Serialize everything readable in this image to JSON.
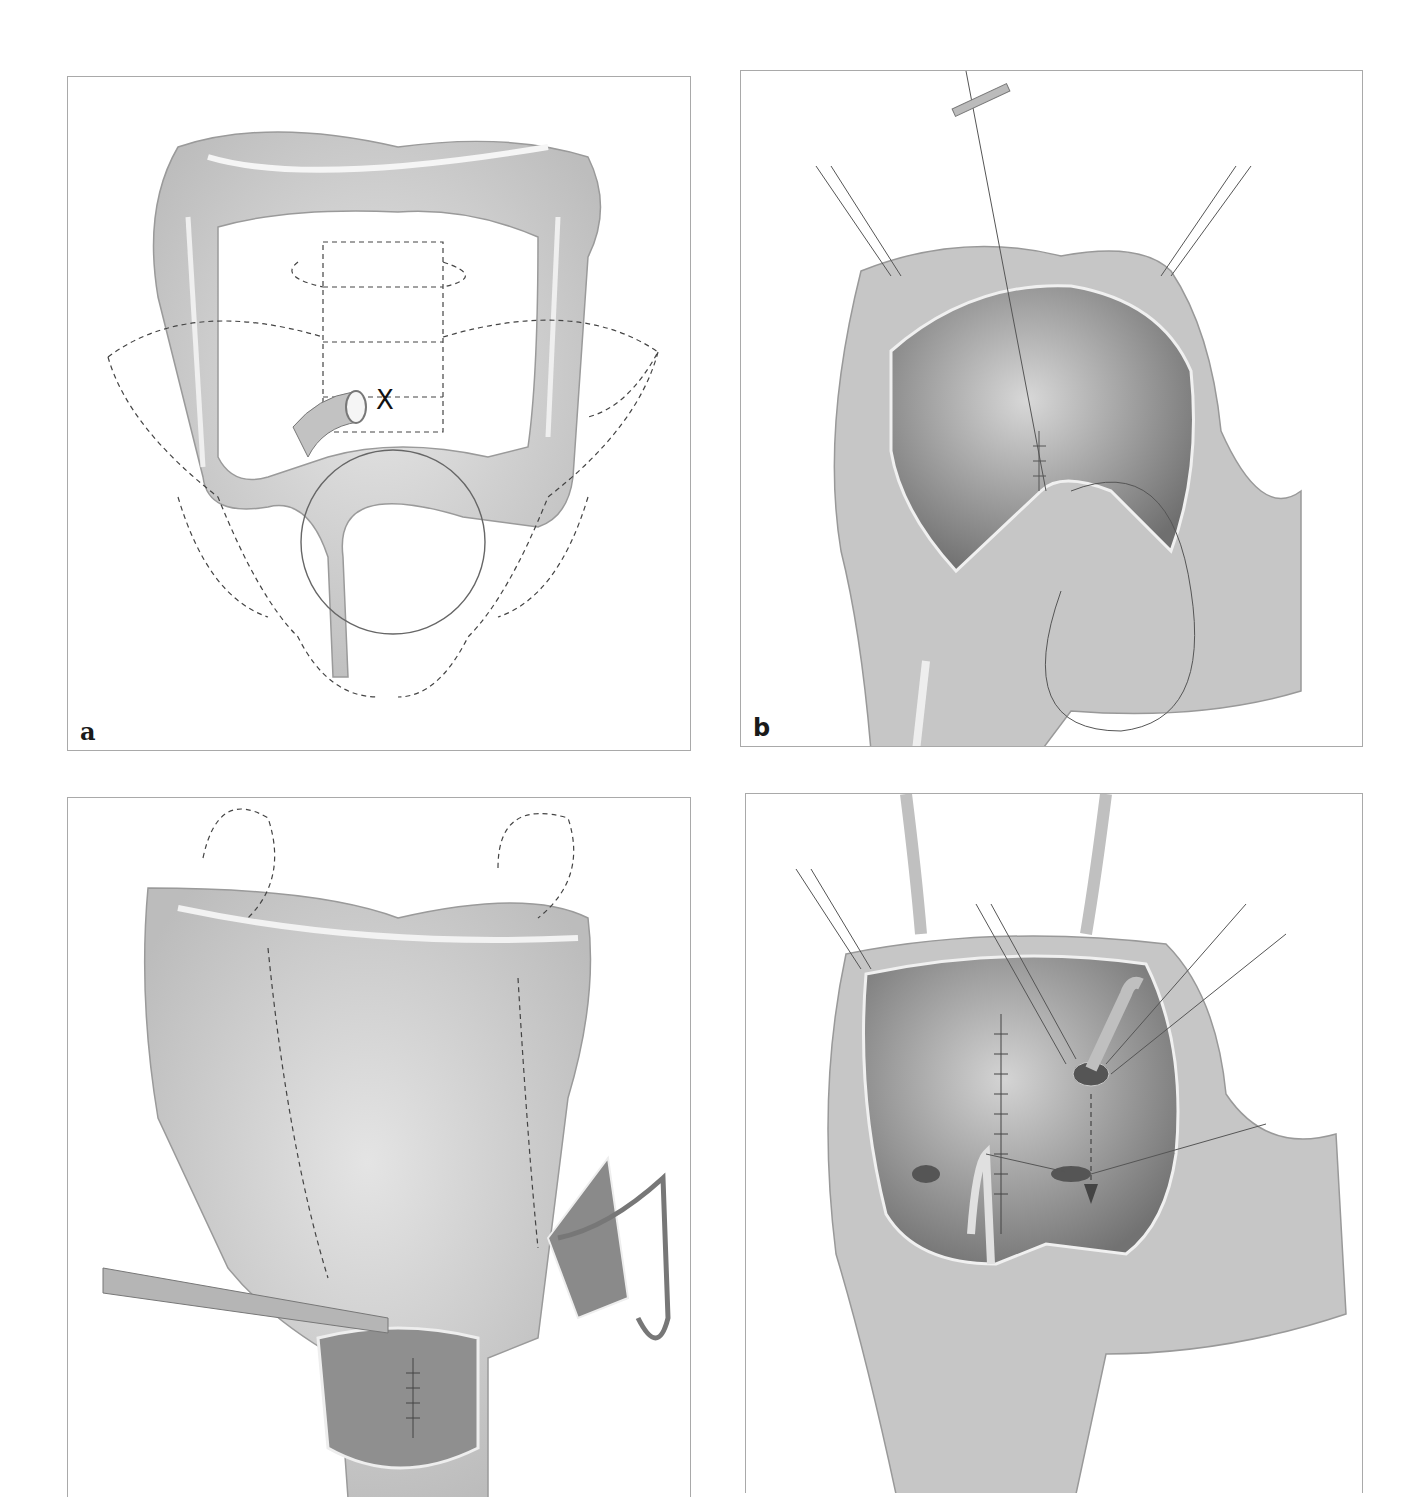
{
  "figure": {
    "panels": [
      {
        "id": "a",
        "label": "a",
        "description": "Colon overview with pelvic skeleton outline (dashed), stoma site marked X, circled rectosigmoid region",
        "marker": "X"
      },
      {
        "id": "b",
        "label": "b",
        "description": "Opened bowel pouch with stay sutures and running suture line"
      },
      {
        "id": "c",
        "label": "",
        "description": "Colon with forceps, opened pouch with suture line, catheter through separate loop"
      },
      {
        "id": "d",
        "label": "",
        "description": "Opened pouch with central suture line, tube drains, dashed arrow and stay sutures"
      }
    ],
    "colors": {
      "frame": "#a9a9a9",
      "tissue": "#c8c8c8",
      "tissue_light": "#e2e2e2",
      "lumen_dark": "#8a8a8a",
      "outline": "#555555",
      "dashed": "#444444"
    }
  }
}
